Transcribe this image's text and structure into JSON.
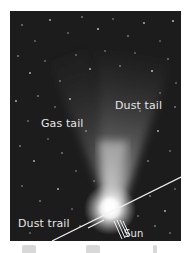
{
  "figure": {
    "type": "annotated astronomical photograph",
    "labels": {
      "dust_tail": "Dust tail",
      "gas_tail": "Gas tail",
      "dust_trail": "Dust trail",
      "sun": "Sun"
    },
    "colors": {
      "sky": "#1c1c1c",
      "tail_glow": "#cfcfcf",
      "nucleus": "#ffffff",
      "label_text": "#e6e6e6",
      "lines": "#f2f2f2",
      "page_background": "#ffffff"
    },
    "icons": {
      "sun_direction": "sun-rays-icon",
      "trail_line": "dust-trail-line"
    }
  }
}
